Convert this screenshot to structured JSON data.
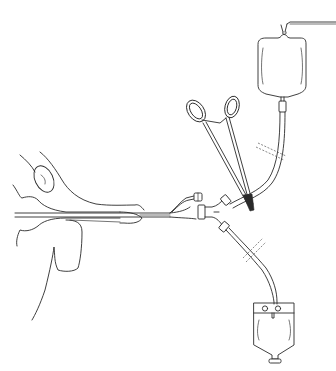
{
  "figure": {
    "type": "line-illustration",
    "subject": "continuous bladder irrigation setup with three-way urinary catheter",
    "colors": {
      "background": "#ffffff",
      "ink": "#2a2a2a"
    },
    "components": [
      {
        "id": "anatomy",
        "name": "male urethra with inserted catheter (side view)"
      },
      {
        "id": "catheter",
        "name": "three-way catheter with balloon inflation port"
      },
      {
        "id": "y-connector",
        "name": "Y-connector joining inflow and outflow tubing"
      },
      {
        "id": "irrigation-bag",
        "name": "irrigation solution bag hung from hook (top)"
      },
      {
        "id": "clamp",
        "name": "hemostat clamp on tubing"
      },
      {
        "id": "drainage-bag",
        "name": "drainage collection bag with outlet valve (bottom)"
      },
      {
        "id": "tubing-break-top",
        "name": "tubing break marks (inflow line)"
      },
      {
        "id": "tubing-break-bottom",
        "name": "tubing break marks (outflow line)"
      }
    ]
  }
}
